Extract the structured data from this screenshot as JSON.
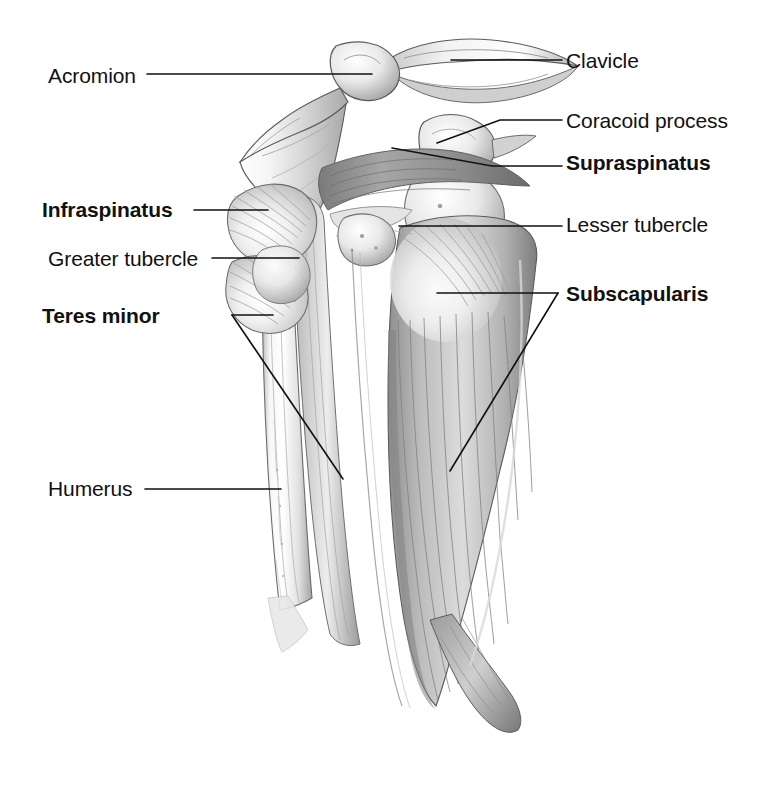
{
  "figure": {
    "background_color": "#ffffff",
    "ink_color": "#111111",
    "style": "grayscale pencil medical illustration",
    "width": 762,
    "height": 800
  },
  "labels": [
    {
      "id": "acromion",
      "text": "Acromion",
      "weight": "regular",
      "side": "left",
      "text_x": 48,
      "text_y": 65,
      "leader": {
        "type": "horizontal",
        "x1": 147,
        "y1": 74,
        "x2": 372,
        "y2": 74
      }
    },
    {
      "id": "clavicle",
      "text": "Clavicle",
      "weight": "regular",
      "side": "right",
      "text_x": 566,
      "text_y": 50,
      "leader": {
        "type": "horizontal",
        "x1": 451,
        "y1": 60,
        "x2": 562,
        "y2": 60
      }
    },
    {
      "id": "coracoid-process",
      "text": "Coracoid process",
      "weight": "regular",
      "side": "right",
      "text_x": 566,
      "text_y": 110,
      "leader": {
        "type": "elbow",
        "x1": 437,
        "y1": 143,
        "x2": 500,
        "y2": 120,
        "x3": 562,
        "y3": 120
      }
    },
    {
      "id": "supraspinatus",
      "text": "Supraspinatus",
      "weight": "bold",
      "side": "right",
      "text_x": 566,
      "text_y": 152,
      "leader": {
        "type": "elbow",
        "x1": 392,
        "y1": 148,
        "x2": 492,
        "y2": 166,
        "x3": 562,
        "y3": 166
      }
    },
    {
      "id": "lesser-tubercle",
      "text": "Lesser tubercle",
      "weight": "regular",
      "side": "right",
      "text_x": 566,
      "text_y": 214,
      "leader": {
        "type": "horizontal",
        "x1": 399,
        "y1": 226,
        "x2": 562,
        "y2": 226
      }
    },
    {
      "id": "subscapularis",
      "text": "Subscapularis",
      "weight": "bold",
      "side": "right",
      "text_x": 566,
      "text_y": 283,
      "leader": {
        "type": "fork",
        "jx": 558,
        "jy": 293,
        "a_x": 437,
        "a_y": 293,
        "b_x": 450,
        "b_y": 471
      }
    },
    {
      "id": "infraspinatus",
      "text": "Infraspinatus",
      "weight": "bold",
      "side": "left",
      "text_x": 42,
      "text_y": 199,
      "leader": {
        "type": "horizontal",
        "x1": 194,
        "y1": 210,
        "x2": 268,
        "y2": 210
      }
    },
    {
      "id": "greater-tubercle",
      "text": "Greater tubercle",
      "weight": "regular",
      "side": "left",
      "text_x": 48,
      "text_y": 248,
      "leader": {
        "type": "horizontal",
        "x1": 212,
        "y1": 258,
        "x2": 299,
        "y2": 258
      }
    },
    {
      "id": "teres-minor",
      "text": "Teres minor",
      "weight": "bold",
      "side": "left",
      "text_x": 42,
      "text_y": 305,
      "leader": {
        "type": "fork",
        "jx": 232,
        "jy": 315,
        "a_x": 273,
        "a_y": 315,
        "b_x": 343,
        "b_y": 479
      }
    },
    {
      "id": "humerus",
      "text": "Humerus",
      "weight": "regular",
      "side": "left",
      "text_x": 48,
      "text_y": 478,
      "leader": {
        "type": "horizontal",
        "x1": 145,
        "y1": 489,
        "x2": 281,
        "y2": 489
      }
    }
  ],
  "structures": [
    {
      "id": "clavicle-bone",
      "name": "Clavicle"
    },
    {
      "id": "acromion-bone",
      "name": "Acromion"
    },
    {
      "id": "scapula-spine",
      "name": "Spine of scapula"
    },
    {
      "id": "coracoid-bone",
      "name": "Coracoid process"
    },
    {
      "id": "humerus-shaft",
      "name": "Humerus"
    },
    {
      "id": "greater-tubercle-bone",
      "name": "Greater tubercle"
    },
    {
      "id": "lesser-tubercle-bone",
      "name": "Lesser tubercle"
    },
    {
      "id": "supraspinatus-muscle",
      "name": "Supraspinatus"
    },
    {
      "id": "infraspinatus-muscle",
      "name": "Infraspinatus"
    },
    {
      "id": "teres-minor-muscle",
      "name": "Teres minor"
    },
    {
      "id": "subscapularis-muscle",
      "name": "Subscapularis"
    }
  ]
}
